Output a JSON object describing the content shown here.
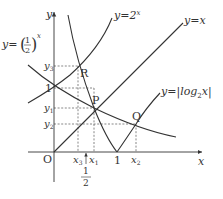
{
  "diagram": {
    "axes": {
      "x_label": "x",
      "y_label": "y",
      "origin_label": "O"
    },
    "curves": {
      "exp2": {
        "label_prefix": "y=2",
        "label_exp": "x"
      },
      "half_exp": {
        "label_prefix": "y=",
        "base_num": "1",
        "base_den": "2",
        "label_exp": "x"
      },
      "identity": {
        "label": "y=x"
      },
      "abs_log": {
        "label_prefix": "y=|log",
        "label_sub": "2",
        "label_suffix": "x|"
      }
    },
    "points": {
      "R": "R",
      "P": "P",
      "Q": "Q"
    },
    "x_ticks": {
      "x3": {
        "base": "x",
        "sub": "3"
      },
      "x1": {
        "base": "x",
        "sub": "1"
      },
      "one": "1",
      "x2": {
        "base": "x",
        "sub": "2"
      },
      "half_num": "1",
      "half_den": "2"
    },
    "y_ticks": {
      "y3": {
        "base": "y",
        "sub": "3"
      },
      "one": "1",
      "y1": {
        "base": "y",
        "sub": "1"
      },
      "y2": {
        "base": "y",
        "sub": "2"
      }
    }
  }
}
